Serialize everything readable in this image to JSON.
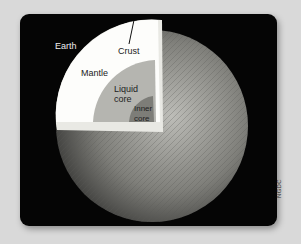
{
  "figure": {
    "title_label": "Earth",
    "layers": [
      {
        "name": "crust",
        "label": "Crust",
        "color": "#ffffff"
      },
      {
        "name": "mantle",
        "label": "Mantle",
        "color": "#f7f7f4"
      },
      {
        "name": "liquid-core",
        "label_line1": "Liquid",
        "label_line2": "core",
        "color": "#b5b5b0"
      },
      {
        "name": "inner-core",
        "label_line1": "Inner",
        "label_line2": "core",
        "color": "#7d7d78"
      }
    ],
    "credit": "NGDC",
    "colors": {
      "background": "#d9d9d9",
      "panel": "#050505",
      "globe": "#8a8a86"
    }
  }
}
